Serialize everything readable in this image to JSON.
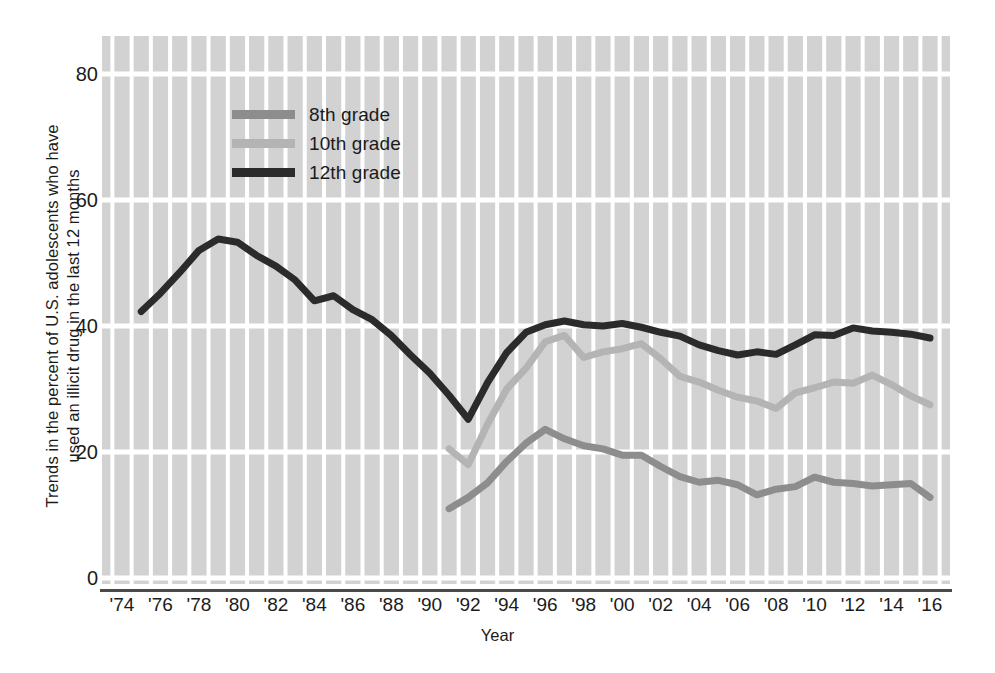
{
  "chart_data": {
    "type": "line",
    "title": "",
    "ylabel": "Trends in the percent of U.S. adolescents  who have\nused an illicit drug in the last 12 months",
    "xlabel": "Year",
    "ylim": [
      0,
      85
    ],
    "xlim": [
      1974,
      2016
    ],
    "grid": true,
    "legend_position": "top-left-inside",
    "y_ticks": [
      {
        "value": 80,
        "label": "80"
      },
      {
        "value": 60,
        "label": "60"
      },
      {
        "value": 40,
        "label": "40"
      },
      {
        "value": 20,
        "label": "20"
      },
      {
        "value": 0,
        "label": "0"
      }
    ],
    "x_ticks": [
      {
        "value": 1974,
        "label": "'74"
      },
      {
        "value": 1976,
        "label": "'76"
      },
      {
        "value": 1978,
        "label": "'78"
      },
      {
        "value": 1980,
        "label": "'80"
      },
      {
        "value": 1982,
        "label": "'82"
      },
      {
        "value": 1984,
        "label": "'84"
      },
      {
        "value": 1986,
        "label": "'86"
      },
      {
        "value": 1988,
        "label": "'88"
      },
      {
        "value": 1990,
        "label": "'90"
      },
      {
        "value": 1992,
        "label": "'92"
      },
      {
        "value": 1994,
        "label": "'94"
      },
      {
        "value": 1996,
        "label": "'96"
      },
      {
        "value": 1998,
        "label": "'98"
      },
      {
        "value": 2000,
        "label": "'00"
      },
      {
        "value": 2002,
        "label": "'02"
      },
      {
        "value": 2004,
        "label": "'04"
      },
      {
        "value": 2006,
        "label": "'06"
      },
      {
        "value": 2008,
        "label": "'08"
      },
      {
        "value": 2010,
        "label": "'10"
      },
      {
        "value": 2012,
        "label": "'12"
      },
      {
        "value": 2014,
        "label": "'14"
      },
      {
        "value": 2016,
        "label": "'16"
      }
    ],
    "series": [
      {
        "name": "8th grade",
        "color": "#8d8d8d",
        "x": [
          1991,
          1992,
          1993,
          1994,
          1995,
          1996,
          1997,
          1998,
          1999,
          2000,
          2001,
          2002,
          2003,
          2004,
          2005,
          2006,
          2007,
          2008,
          2009,
          2010,
          2011,
          2012,
          2013,
          2014,
          2015,
          2016
        ],
        "values": [
          11.0,
          12.8,
          15.1,
          18.5,
          21.4,
          23.6,
          22.1,
          21.0,
          20.5,
          19.5,
          19.5,
          17.7,
          16.1,
          15.2,
          15.5,
          14.8,
          13.2,
          14.1,
          14.5,
          16.0,
          15.2,
          15.0,
          14.6,
          14.8,
          15.0,
          12.8
        ]
      },
      {
        "name": "10th grade",
        "color": "#b4b4b4",
        "x": [
          1991,
          1992,
          1993,
          1994,
          1995,
          1996,
          1997,
          1998,
          1999,
          2000,
          2001,
          2002,
          2003,
          2004,
          2005,
          2006,
          2007,
          2008,
          2009,
          2010,
          2011,
          2012,
          2013,
          2014,
          2015,
          2016
        ],
        "values": [
          20.5,
          18.0,
          24.4,
          30.0,
          33.3,
          37.5,
          38.5,
          35.0,
          35.9,
          36.4,
          37.2,
          34.8,
          32.0,
          31.1,
          29.8,
          28.7,
          28.1,
          26.9,
          29.4,
          30.2,
          31.1,
          30.9,
          32.2,
          30.7,
          28.9,
          27.5
        ]
      },
      {
        "name": "12th grade",
        "color": "#2b2b2b",
        "x": [
          1975,
          1976,
          1977,
          1978,
          1979,
          1980,
          1981,
          1982,
          1983,
          1984,
          1985,
          1986,
          1987,
          1988,
          1989,
          1990,
          1991,
          1992,
          1993,
          1994,
          1995,
          1996,
          1997,
          1998,
          1999,
          2000,
          2001,
          2002,
          2003,
          2004,
          2005,
          2006,
          2007,
          2008,
          2009,
          2010,
          2011,
          2012,
          2013,
          2014,
          2015,
          2016
        ],
        "values": [
          42.3,
          45.2,
          48.5,
          52.0,
          53.8,
          53.3,
          51.2,
          49.5,
          47.3,
          44.0,
          44.8,
          42.6,
          41.0,
          38.5,
          35.4,
          32.5,
          29.0,
          25.2,
          31.0,
          35.8,
          39.0,
          40.2,
          40.8,
          40.2,
          40.0,
          40.4,
          39.8,
          39.0,
          38.4,
          37.0,
          36.1,
          35.4,
          35.9,
          35.5,
          37.0,
          38.6,
          38.5,
          39.7,
          39.2,
          39.0,
          38.7,
          38.1
        ]
      }
    ]
  },
  "legend": {
    "items": [
      {
        "label": "8th grade",
        "color": "#8d8d8d"
      },
      {
        "label": "10th grade",
        "color": "#b4b4b4"
      },
      {
        "label": "12th grade",
        "color": "#2b2b2b"
      }
    ]
  },
  "colors": {
    "plot_background": "#d2d2d2",
    "gridline": "#ffffff",
    "axis_line": "#4a4a4a",
    "page_background": "#ffffff",
    "text": "#1b1b1b"
  }
}
